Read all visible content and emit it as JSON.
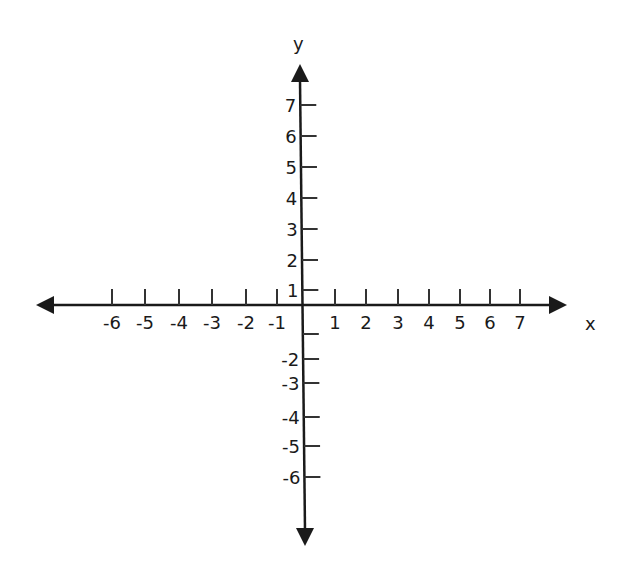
{
  "chart_data": {
    "type": "scatter",
    "title": "",
    "xlabel": "x",
    "ylabel": "y",
    "x_ticks": [
      -6,
      -5,
      -4,
      -3,
      -2,
      -1,
      1,
      2,
      3,
      4,
      5,
      6,
      7
    ],
    "y_ticks": [
      7,
      6,
      5,
      4,
      3,
      2,
      1,
      -2,
      -3,
      -4,
      -5,
      -6
    ],
    "y_unlabeled_ticks": [
      -1
    ],
    "xlim": [
      -8,
      8
    ],
    "ylim": [
      -8,
      8
    ],
    "grid": false,
    "legend": null,
    "series": []
  },
  "colors": {
    "axis": "#1a1a1a",
    "tick": "#333333",
    "background": "#ffffff"
  }
}
